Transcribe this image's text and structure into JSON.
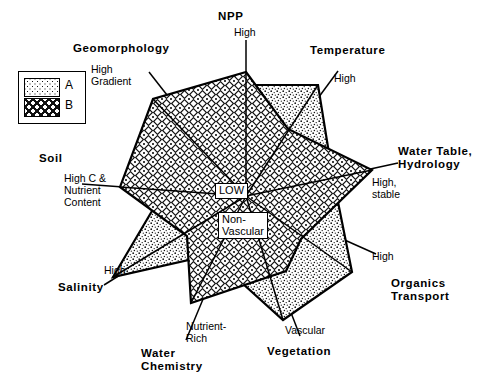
{
  "legend": {
    "items": [
      {
        "key": "A",
        "label": "A",
        "pattern": "stipple"
      },
      {
        "key": "B",
        "label": "B",
        "pattern": "diamond"
      }
    ]
  },
  "center": {
    "primary": "LOW",
    "secondary": "Non-\nVascular"
  },
  "colors": {
    "line": "#000000",
    "background": "#ffffff",
    "pattern_a": "#000000",
    "pattern_b": "#000000"
  },
  "axes": [
    {
      "name": "npp",
      "title": "NPP",
      "sub": "High"
    },
    {
      "name": "temperature",
      "title": "Temperature",
      "sub": "High"
    },
    {
      "name": "water-table",
      "title": "Water Table,\nHydrology",
      "sub": "High,\nstable"
    },
    {
      "name": "organics",
      "title": "Organics\nTransport",
      "sub": "High"
    },
    {
      "name": "vegetation",
      "title": "Vegetation",
      "sub": "Vascular"
    },
    {
      "name": "water-chemistry",
      "title": "Water\nChemistry",
      "sub": "Nutrient-\nRich"
    },
    {
      "name": "salinity",
      "title": "Salinity",
      "sub": "High"
    },
    {
      "name": "soil",
      "title": "Soil",
      "sub": "High C &\nNutrient\nContent"
    },
    {
      "name": "geomorphology",
      "title": "Geomorphology",
      "sub": "High\nGradient"
    }
  ],
  "chart_data": {
    "type": "radar",
    "title": "",
    "center_labels": {
      "inner": "LOW",
      "inner_secondary": "Non-Vascular"
    },
    "axis_min_label": "LOW",
    "categories": [
      "NPP",
      "Temperature",
      "Water Table, Hydrology",
      "Organics Transport",
      "Vegetation",
      "Water Chemistry",
      "Salinity",
      "Soil",
      "Geomorphology"
    ],
    "axis_high_labels": [
      "High",
      "High",
      "High, stable",
      "High",
      "Vascular",
      "Nutrient-Rich",
      "High",
      "High C & Nutrient Content",
      "High Gradient"
    ],
    "rlim": [
      0,
      100
    ],
    "grid": false,
    "legend_position": "top-left",
    "series": [
      {
        "name": "A",
        "pattern": "stipple",
        "values": [
          78,
          92,
          52,
          88,
          95,
          40,
          90,
          58,
          30
        ]
      },
      {
        "name": "B",
        "pattern": "diamond",
        "values": [
          95,
          44,
          97,
          35,
          62,
          85,
          30,
          92,
          96
        ]
      }
    ]
  },
  "geometry": {
    "center": {
      "x": 246,
      "y": 196
    },
    "axis_angles_deg": [
      90,
      50,
      12,
      -28,
      -62,
      -105,
      -150,
      180,
      135
    ],
    "series_points": {
      "A": [
        {
          "x": 246,
          "y": 85
        },
        {
          "x": 318,
          "y": 85
        },
        {
          "x": 332,
          "y": 172
        },
        {
          "x": 352,
          "y": 272
        },
        {
          "x": 283,
          "y": 320
        },
        {
          "x": 211,
          "y": 255
        },
        {
          "x": 113,
          "y": 277
        },
        {
          "x": 152,
          "y": 211
        },
        {
          "x": 206,
          "y": 121
        }
      ],
      "B": [
        {
          "x": 246,
          "y": 72
        },
        {
          "x": 288,
          "y": 129
        },
        {
          "x": 372,
          "y": 170
        },
        {
          "x": 301,
          "y": 239
        },
        {
          "x": 286,
          "y": 271
        },
        {
          "x": 191,
          "y": 303
        },
        {
          "x": 187,
          "y": 236
        },
        {
          "x": 120,
          "y": 187
        },
        {
          "x": 153,
          "y": 99
        }
      ]
    },
    "axis_line_ends": [
      {
        "x": 246,
        "y": 40
      },
      {
        "x": 338,
        "y": 71
      },
      {
        "x": 398,
        "y": 163
      },
      {
        "x": 376,
        "y": 254
      },
      {
        "x": 300,
        "y": 336
      },
      {
        "x": 186,
        "y": 340
      },
      {
        "x": 104,
        "y": 285
      },
      {
        "x": 82,
        "y": 184
      },
      {
        "x": 149,
        "y": 72
      }
    ]
  }
}
